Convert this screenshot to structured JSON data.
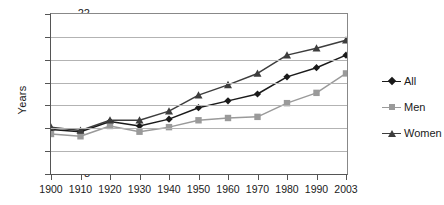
{
  "chart_data": {
    "type": "line",
    "title": "",
    "xlabel": "",
    "ylabel": "Years",
    "categories": [
      "1900",
      "1910",
      "1920",
      "1930",
      "1940",
      "1950",
      "1960",
      "1970",
      "1980",
      "1990",
      "2003"
    ],
    "x": [
      1900,
      1910,
      1920,
      1930,
      1940,
      1950,
      1960,
      1970,
      1980,
      1990,
      2003
    ],
    "ylim": [
      8,
      22
    ],
    "yticks": [
      8,
      10,
      12,
      14,
      16,
      18,
      20,
      22
    ],
    "ytick_labels": [
      "8",
      "10",
      "12",
      "14",
      "16",
      "18",
      "20",
      "22"
    ],
    "grid": true,
    "legend_position": "right",
    "series": [
      {
        "name": "All",
        "color": "#1a1a1a",
        "marker": "diamond",
        "values": [
          11.9,
          11.7,
          12.6,
          12.2,
          12.8,
          13.8,
          14.4,
          15.0,
          16.5,
          17.3,
          18.4
        ]
      },
      {
        "name": "Men",
        "color": "#9a9a9a",
        "marker": "square",
        "values": [
          11.5,
          11.3,
          12.2,
          11.7,
          12.1,
          12.7,
          12.9,
          13.0,
          14.2,
          15.1,
          16.8
        ]
      },
      {
        "name": "Women",
        "color": "#3d3d3d",
        "marker": "triangle",
        "values": [
          12.1,
          11.8,
          12.7,
          12.7,
          13.5,
          14.9,
          15.8,
          16.8,
          18.4,
          19.0,
          19.7
        ]
      }
    ]
  },
  "legend": {
    "items": [
      {
        "label": "All"
      },
      {
        "label": "Men"
      },
      {
        "label": "Women"
      }
    ]
  },
  "axes": {
    "y_title": "Years"
  }
}
